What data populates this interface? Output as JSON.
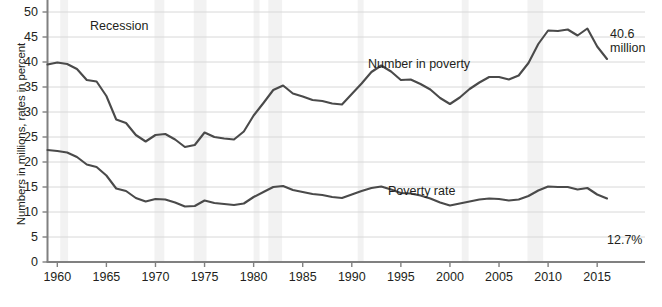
{
  "axes": {
    "ylabel": "Numbers in millions, rates in percent",
    "yticks": [
      0,
      5,
      10,
      15,
      20,
      25,
      30,
      35,
      40,
      45,
      50
    ],
    "xticks": [
      1960,
      1965,
      1970,
      1975,
      1980,
      1985,
      1990,
      1995,
      2000,
      2005,
      2010,
      2015
    ]
  },
  "annotations": {
    "recession": "Recession",
    "number_label": "Number in poverty",
    "rate_label": "Poverty rate",
    "end_number_line1": "40.6",
    "end_number_line2": "million",
    "end_rate": "12.7%"
  },
  "colors": {
    "line": "#4a4a4a",
    "grid": "#d8d8d8",
    "axis": "#808080",
    "recession_band": "#f2f2f2",
    "text": "#231f20",
    "background": "#ffffff"
  },
  "chart_data": {
    "type": "line",
    "title": "",
    "subtitle": "",
    "xlabel": "",
    "ylabel": "Numbers in millions, rates in percent",
    "xlim": [
      1959,
      2016
    ],
    "ylim": [
      0,
      50
    ],
    "grid": true,
    "legend": "inline-annotations",
    "x": [
      1959,
      1960,
      1961,
      1962,
      1963,
      1964,
      1965,
      1966,
      1967,
      1968,
      1969,
      1970,
      1971,
      1972,
      1973,
      1974,
      1975,
      1976,
      1977,
      1978,
      1979,
      1980,
      1981,
      1982,
      1983,
      1984,
      1985,
      1986,
      1987,
      1988,
      1989,
      1990,
      1991,
      1992,
      1993,
      1994,
      1995,
      1996,
      1997,
      1998,
      1999,
      2000,
      2001,
      2002,
      2003,
      2004,
      2005,
      2006,
      2007,
      2008,
      2009,
      2010,
      2011,
      2012,
      2013,
      2014,
      2015,
      2016
    ],
    "series": [
      {
        "name": "Number in poverty",
        "units": "millions",
        "annotation": "40.6 million",
        "values": [
          39.5,
          39.9,
          39.6,
          38.6,
          36.4,
          36.1,
          33.2,
          28.5,
          27.8,
          25.4,
          24.1,
          25.4,
          25.6,
          24.5,
          23.0,
          23.4,
          25.9,
          25.0,
          24.7,
          24.5,
          26.1,
          29.3,
          31.8,
          34.4,
          35.3,
          33.7,
          33.1,
          32.4,
          32.2,
          31.7,
          31.5,
          33.6,
          35.7,
          38.0,
          39.3,
          38.1,
          36.4,
          36.5,
          35.6,
          34.5,
          32.8,
          31.6,
          32.9,
          34.6,
          35.9,
          37.0,
          37.0,
          36.5,
          37.3,
          39.8,
          43.6,
          46.3,
          46.2,
          46.5,
          45.3,
          46.7,
          43.1,
          40.6
        ]
      },
      {
        "name": "Poverty rate",
        "units": "percent",
        "annotation": "12.7%",
        "values": [
          22.4,
          22.2,
          21.9,
          21.0,
          19.5,
          19.0,
          17.3,
          14.7,
          14.2,
          12.8,
          12.1,
          12.6,
          12.5,
          11.9,
          11.1,
          11.2,
          12.3,
          11.8,
          11.6,
          11.4,
          11.7,
          13.0,
          14.0,
          15.0,
          15.2,
          14.4,
          14.0,
          13.6,
          13.4,
          13.0,
          12.8,
          13.5,
          14.2,
          14.8,
          15.1,
          14.5,
          13.8,
          13.7,
          13.3,
          12.7,
          11.9,
          11.3,
          11.7,
          12.1,
          12.5,
          12.7,
          12.6,
          12.3,
          12.5,
          13.2,
          14.3,
          15.1,
          15.0,
          15.0,
          14.5,
          14.8,
          13.5,
          12.7
        ]
      }
    ],
    "recessions": [
      {
        "start": 1960.3,
        "end": 1961.1
      },
      {
        "start": 1969.9,
        "end": 1970.9
      },
      {
        "start": 1973.9,
        "end": 1975.2
      },
      {
        "start": 1980.0,
        "end": 1980.6
      },
      {
        "start": 1981.5,
        "end": 1982.9
      },
      {
        "start": 1990.6,
        "end": 1991.2
      },
      {
        "start": 2001.2,
        "end": 2001.9
      },
      {
        "start": 2007.9,
        "end": 2009.5
      }
    ]
  }
}
